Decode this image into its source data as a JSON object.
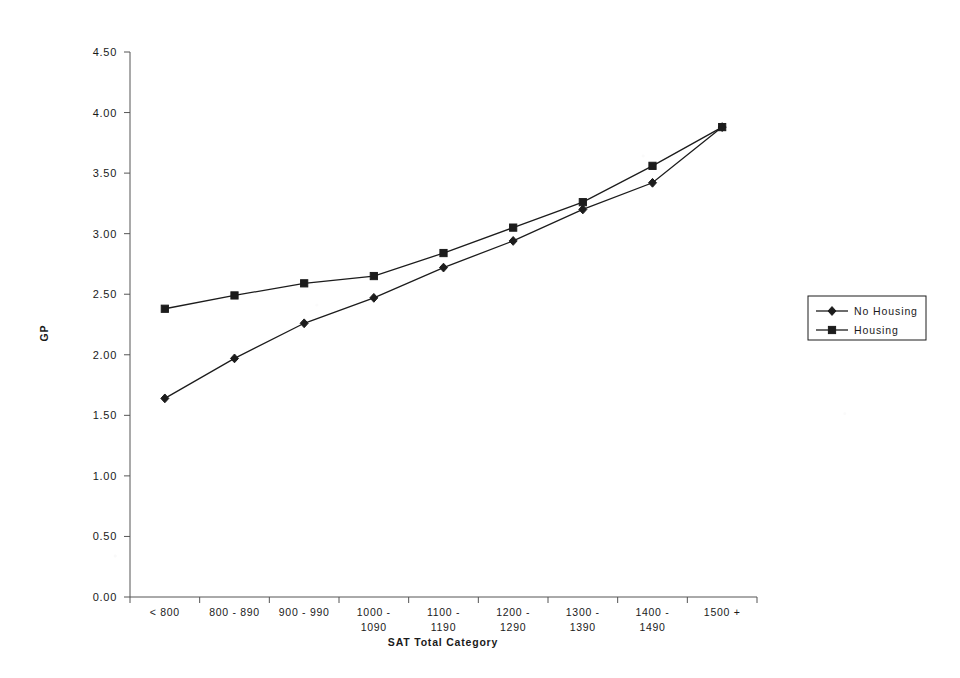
{
  "chart_data": {
    "type": "line",
    "title": "",
    "xlabel": "SAT Total Category",
    "ylabel": "GP",
    "categories": [
      "< 800",
      "800 - 890",
      "900 - 990",
      "1000 - 1090",
      "1100 - 1190",
      "1200 - 1290",
      "1300 - 1390",
      "1400 - 1490",
      "1500 +"
    ],
    "ylim": [
      0.0,
      4.5
    ],
    "ytick_labels": [
      "4.50",
      "4.00",
      "3.50",
      "3.00",
      "2.50",
      "2.00",
      "1.50",
      "1.00",
      "0.50",
      "0.00"
    ],
    "ytick_values": [
      4.5,
      4.0,
      3.5,
      3.0,
      2.5,
      2.0,
      1.5,
      1.0,
      0.5,
      0.0
    ],
    "grid": false,
    "legend_position": "right",
    "series": [
      {
        "name": "No Housing",
        "marker": "diamond",
        "color": "#1c1c1c",
        "values": [
          1.64,
          1.97,
          2.26,
          2.47,
          2.72,
          2.94,
          3.2,
          3.42,
          3.88
        ]
      },
      {
        "name": "Housing",
        "marker": "square",
        "color": "#1c1c1c",
        "values": [
          2.38,
          2.49,
          2.59,
          2.65,
          2.84,
          3.05,
          3.26,
          3.56,
          3.88
        ]
      }
    ]
  },
  "legend": {
    "entries": [
      {
        "label": "No Housing",
        "marker": "diamond-marker-icon"
      },
      {
        "label": "Housing",
        "marker": "square-marker-icon"
      }
    ]
  },
  "axes": {
    "y_title": "GP",
    "x_title": "SAT Total Category"
  }
}
